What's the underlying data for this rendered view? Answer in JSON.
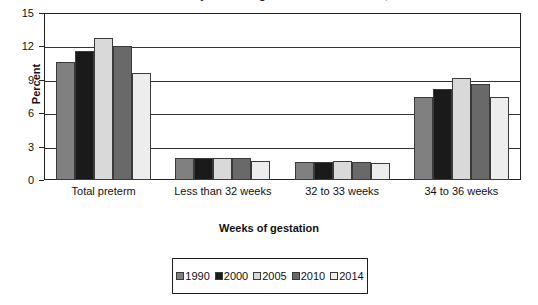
{
  "chart_data": {
    "type": "bar",
    "title": "Preterm birth rates by weeks of gestation: United States, 1990–2014",
    "title_visible": false,
    "xlabel": "Weeks of gestation",
    "ylabel": "Percent",
    "ylim": [
      0,
      15
    ],
    "yticks": [
      0,
      3,
      6,
      9,
      12,
      15
    ],
    "grid": true,
    "legend_position": "bottom",
    "categories": [
      "Total preterm",
      "Less than 32 weeks",
      "32 to 33 weeks",
      "34 to 36 weeks"
    ],
    "series": [
      {
        "name": "1990",
        "color": "#808080",
        "values": [
          10.6,
          2.0,
          1.6,
          7.5
        ]
      },
      {
        "name": "2000",
        "color": "#1a1a1a",
        "values": [
          11.6,
          2.0,
          1.6,
          8.2
        ]
      },
      {
        "name": "2005",
        "color": "#d9d9d9",
        "values": [
          12.8,
          2.0,
          1.7,
          9.2
        ]
      },
      {
        "name": "2010",
        "color": "#696969",
        "values": [
          12.0,
          2.0,
          1.6,
          8.6
        ]
      },
      {
        "name": "2014",
        "color": "#ededed",
        "values": [
          9.6,
          1.7,
          1.5,
          7.5
        ]
      }
    ]
  },
  "axis": {
    "y_title": "Percent",
    "x_title": "Weeks of gestation",
    "y_tick_labels": [
      "15",
      "12",
      "9",
      "6",
      "3",
      "0"
    ]
  },
  "legend": {
    "entries": [
      {
        "label": "1990",
        "color": "#808080"
      },
      {
        "label": "2000",
        "color": "#1a1a1a"
      },
      {
        "label": "2005",
        "color": "#d9d9d9"
      },
      {
        "label": "2010",
        "color": "#696969"
      },
      {
        "label": "2014",
        "color": "#ededed"
      }
    ]
  }
}
